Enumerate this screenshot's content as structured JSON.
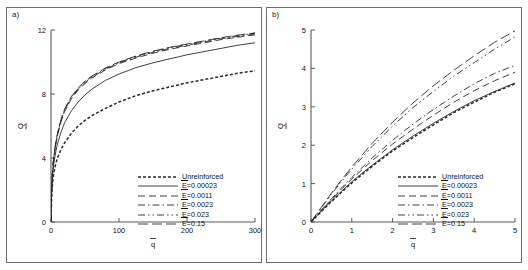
{
  "figure": {
    "background": "#fdfdfd",
    "panel_count": 2
  },
  "panels": [
    {
      "id": "a",
      "label": "a)",
      "xlabel": "q̅",
      "ylabel": "Q̅",
      "xticks": [
        "0",
        "100",
        "200",
        "300"
      ],
      "yticks": [
        "0",
        "4",
        "8",
        "12"
      ]
    },
    {
      "id": "b",
      "label": "b)",
      "xlabel": "q̅",
      "ylabel": "Q̅",
      "xticks": [
        "0",
        "1",
        "2",
        "3",
        "4",
        "5"
      ],
      "yticks": [
        "0",
        "1",
        "2",
        "3",
        "4",
        "5"
      ]
    }
  ],
  "legend": {
    "entries": [
      {
        "label": "Unreinforced",
        "style": "dotted"
      },
      {
        "label": "E̅=0.00023",
        "style": "solid"
      },
      {
        "label": "E̅=0.0011",
        "style": "dashed"
      },
      {
        "label": "E̅=0.0023",
        "style": "dash-dot"
      },
      {
        "label": "E̅=0.023",
        "style": "dash-dot-dot"
      },
      {
        "label": "E̅=0.15",
        "style": "long-dash"
      }
    ]
  },
  "chart_data": [
    {
      "type": "line",
      "panel": "a",
      "title": "",
      "xlabel": "q̅",
      "ylabel": "Q̅",
      "xlim": [
        0,
        300
      ],
      "ylim": [
        0,
        12
      ],
      "xticks": [
        0,
        100,
        200,
        300
      ],
      "yticks": [
        0,
        4,
        8,
        12
      ],
      "grid": false,
      "legend_position": "lower-right",
      "x": [
        0,
        1,
        2,
        4,
        7,
        10,
        15,
        20,
        30,
        40,
        50,
        60,
        80,
        100,
        125,
        150,
        175,
        200,
        225,
        250,
        275,
        300
      ],
      "series": [
        {
          "name": "Unreinforced",
          "style": "dotted",
          "values": [
            0,
            1.65,
            2.3,
            3.05,
            3.65,
            4.05,
            4.55,
            4.95,
            5.55,
            6.0,
            6.35,
            6.65,
            7.1,
            7.5,
            7.9,
            8.2,
            8.45,
            8.7,
            8.9,
            9.1,
            9.3,
            9.45
          ]
        },
        {
          "name": "E̅=0.00023",
          "style": "solid",
          "values": [
            0,
            1.9,
            2.7,
            3.6,
            4.4,
            4.95,
            5.65,
            6.2,
            6.95,
            7.5,
            7.95,
            8.3,
            8.85,
            9.25,
            9.65,
            9.95,
            10.2,
            10.45,
            10.65,
            10.85,
            11.05,
            11.2
          ]
        },
        {
          "name": "E̅=0.0011",
          "style": "dashed",
          "values": [
            0,
            2.05,
            2.95,
            3.95,
            4.85,
            5.5,
            6.3,
            6.9,
            7.7,
            8.25,
            8.65,
            9.0,
            9.5,
            9.9,
            10.25,
            10.55,
            10.8,
            11.0,
            11.2,
            11.4,
            11.55,
            11.7
          ]
        },
        {
          "name": "E̅=0.0023",
          "style": "dash-dot",
          "values": [
            0,
            2.1,
            3.0,
            4.0,
            4.9,
            5.55,
            6.38,
            6.98,
            7.78,
            8.3,
            8.72,
            9.05,
            9.55,
            9.95,
            10.3,
            10.6,
            10.85,
            11.05,
            11.25,
            11.45,
            11.6,
            11.75
          ]
        },
        {
          "name": "E̅=0.023",
          "style": "dash-dot-dot",
          "values": [
            0,
            2.12,
            3.05,
            4.05,
            4.95,
            5.6,
            6.42,
            7.02,
            7.82,
            8.35,
            8.76,
            9.1,
            9.6,
            9.98,
            10.35,
            10.65,
            10.9,
            11.1,
            11.3,
            11.5,
            11.65,
            11.8
          ]
        },
        {
          "name": "E̅=0.15",
          "style": "long-dash",
          "values": [
            0,
            2.15,
            3.08,
            4.08,
            4.98,
            5.63,
            6.45,
            7.05,
            7.85,
            8.38,
            8.8,
            9.12,
            9.62,
            10.0,
            10.38,
            10.68,
            10.92,
            11.12,
            11.32,
            11.52,
            11.68,
            11.82
          ]
        }
      ]
    },
    {
      "type": "line",
      "panel": "b",
      "title": "",
      "xlabel": "q̅",
      "ylabel": "Q̅",
      "xlim": [
        0,
        5
      ],
      "ylim": [
        0,
        5
      ],
      "xticks": [
        0,
        1,
        2,
        3,
        4,
        5
      ],
      "yticks": [
        0,
        1,
        2,
        3,
        4,
        5
      ],
      "grid": false,
      "legend_position": "lower-right",
      "x": [
        0,
        0.25,
        0.5,
        0.75,
        1,
        1.5,
        2,
        2.5,
        3,
        3.5,
        4,
        4.5,
        5
      ],
      "series": [
        {
          "name": "Unreinforced",
          "style": "dotted",
          "values": [
            0,
            0.27,
            0.53,
            0.78,
            1.02,
            1.45,
            1.85,
            2.2,
            2.53,
            2.85,
            3.12,
            3.38,
            3.6
          ]
        },
        {
          "name": "E̅=0.00023",
          "style": "solid",
          "values": [
            0,
            0.28,
            0.55,
            0.8,
            1.05,
            1.48,
            1.88,
            2.24,
            2.57,
            2.88,
            3.16,
            3.4,
            3.62
          ]
        },
        {
          "name": "E̅=0.0011",
          "style": "dashed",
          "values": [
            0,
            0.3,
            0.58,
            0.86,
            1.12,
            1.6,
            2.03,
            2.42,
            2.78,
            3.12,
            3.42,
            3.68,
            3.9
          ]
        },
        {
          "name": "E̅=0.0023",
          "style": "dash-dot",
          "values": [
            0,
            0.31,
            0.6,
            0.89,
            1.16,
            1.67,
            2.13,
            2.55,
            2.93,
            3.28,
            3.6,
            3.87,
            4.08
          ]
        },
        {
          "name": "E̅=0.023",
          "style": "dash-dot-dot",
          "values": [
            0,
            0.37,
            0.72,
            1.06,
            1.38,
            1.97,
            2.5,
            2.98,
            3.4,
            3.8,
            4.15,
            4.5,
            4.82
          ]
        },
        {
          "name": "E̅=0.15",
          "style": "long-dash",
          "values": [
            0,
            0.38,
            0.75,
            1.1,
            1.43,
            2.05,
            2.6,
            3.1,
            3.55,
            3.95,
            4.33,
            4.68,
            4.98
          ]
        }
      ]
    }
  ]
}
